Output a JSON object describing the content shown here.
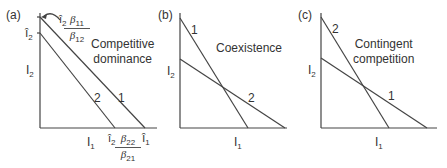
{
  "figure": {
    "panels": [
      {
        "id": "a",
        "label": "(a)",
        "title_line1": "Competitive",
        "title_line2": "dominance",
        "y_axis_label": "I",
        "y_axis_sub": "2",
        "x_axis_label": "I",
        "x_axis_sub": "1",
        "y_tick_label": "î",
        "y_tick_sub": "2",
        "x_tick_label": "î",
        "x_tick_sub": "1",
        "line_labels": [
          "1",
          "2"
        ],
        "y_intercept_annotation": {
          "prefix": "î",
          "prefix_sub": "2",
          "num": "β",
          "num_sub": "11",
          "den": "β",
          "den_sub": "12"
        },
        "x_intercept_annotation": {
          "prefix": "î",
          "prefix_sub": "2",
          "num": "β",
          "num_sub": "22",
          "den": "β",
          "den_sub": "21"
        }
      },
      {
        "id": "b",
        "label": "(b)",
        "title_line1": "Coexistence",
        "y_axis_label": "I",
        "y_axis_sub": "2",
        "x_axis_label": "I",
        "x_axis_sub": "1",
        "line_labels": [
          "1",
          "2"
        ]
      },
      {
        "id": "c",
        "label": "(c)",
        "title_line1": "Contingent",
        "title_line2": "competition",
        "y_axis_label": "I",
        "y_axis_sub": "2",
        "x_axis_label": "I",
        "x_axis_sub": "1",
        "line_labels": [
          "2",
          "1"
        ]
      }
    ],
    "colors": {
      "line": "#444444",
      "text": "#333333"
    }
  }
}
